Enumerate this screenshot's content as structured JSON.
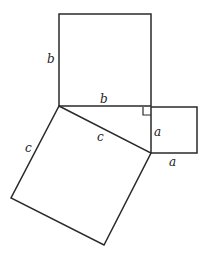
{
  "diagram": {
    "title": "",
    "labels": {
      "square_b_side": "b",
      "triangle_leg_b": "b",
      "triangle_leg_a": "a",
      "square_a_side": "a",
      "hypotenuse": "c",
      "square_c_side": "c"
    },
    "shapes": {
      "square_b": [
        [
          59,
          14
        ],
        [
          151,
          14
        ],
        [
          151,
          106
        ],
        [
          59,
          106
        ]
      ],
      "square_a": [
        [
          151,
          107
        ],
        [
          197,
          107
        ],
        [
          197,
          153
        ],
        [
          151,
          153
        ]
      ],
      "square_c": [
        [
          59,
          106
        ],
        [
          151,
          153
        ],
        [
          104,
          245
        ],
        [
          11,
          198
        ]
      ],
      "right_angle_marker": [
        [
          143,
          107
        ],
        [
          143,
          115
        ],
        [
          151,
          115
        ]
      ]
    },
    "colors": {
      "stroke": "#2a2a2a",
      "text": "#222222",
      "background": "#ffffff"
    }
  }
}
